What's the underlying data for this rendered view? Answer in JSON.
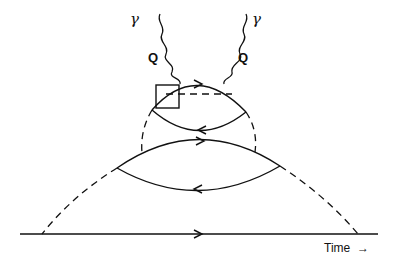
{
  "diagram": {
    "type": "feynman-diagram",
    "labels": {
      "photon_left": "γ",
      "photon_right": "γ",
      "momentum_left": "Q",
      "momentum_right": "Q",
      "time_axis": "Time",
      "time_arrow": "→"
    },
    "elements": [
      {
        "name": "incoming-photon-left",
        "kind": "wavy-line"
      },
      {
        "name": "incoming-photon-right",
        "kind": "wavy-line"
      },
      {
        "name": "upper-loop-top",
        "kind": "solid-line",
        "arrow": "right"
      },
      {
        "name": "upper-loop-bottom",
        "kind": "solid-line",
        "arrow": "left"
      },
      {
        "name": "lower-loop-top",
        "kind": "solid-line",
        "arrow": "right"
      },
      {
        "name": "lower-loop-bottom",
        "kind": "solid-line",
        "arrow": "left"
      },
      {
        "name": "baseline",
        "kind": "solid-line",
        "arrow": "right"
      },
      {
        "name": "vertex-box",
        "kind": "square"
      },
      {
        "name": "horizontal-dashed-propagator",
        "kind": "dashed-line"
      },
      {
        "name": "inner-dashed-propagators",
        "kind": "dashed-line"
      },
      {
        "name": "outer-dashed-propagators",
        "kind": "dashed-line"
      }
    ]
  }
}
